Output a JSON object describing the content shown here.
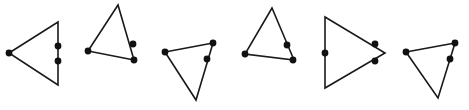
{
  "figure": {
    "canvas": {
      "width": 469,
      "height": 110,
      "background": "#ffffff"
    },
    "style": {
      "stroke_color": "#1a1a1a",
      "stroke_width": 1.6,
      "dot_color": "#111111",
      "dot_radius": 3.4
    },
    "shape_count": 6,
    "shapes": [
      {
        "name": "triangle-1",
        "orientation": "pointing-left",
        "points": "9,53 58,22 58,85",
        "dots": [
          {
            "name": "dot-apex-left",
            "cx": 9,
            "cy": 53
          },
          {
            "name": "dot-right-edge-upper",
            "cx": 58,
            "cy": 46
          },
          {
            "name": "dot-right-edge-lower",
            "cx": 58,
            "cy": 61
          }
        ]
      },
      {
        "name": "triangle-2",
        "orientation": "pointing-up-tilted",
        "points": "118,5 88,51 134,60",
        "dots": [
          {
            "name": "dot-bottom-left",
            "cx": 88,
            "cy": 51
          },
          {
            "name": "dot-right-edge",
            "cx": 133,
            "cy": 44
          },
          {
            "name": "dot-bottom-right",
            "cx": 134,
            "cy": 60
          }
        ]
      },
      {
        "name": "triangle-3",
        "orientation": "pointing-down-tilted",
        "points": "165,52 213,43 196,100",
        "dots": [
          {
            "name": "dot-top-left",
            "cx": 165,
            "cy": 52
          },
          {
            "name": "dot-top-right",
            "cx": 213,
            "cy": 43
          },
          {
            "name": "dot-right-edge",
            "cx": 207,
            "cy": 59
          }
        ]
      },
      {
        "name": "triangle-4",
        "orientation": "pointing-up",
        "points": "272,8 245,54 294,60",
        "dots": [
          {
            "name": "dot-bottom-left",
            "cx": 245,
            "cy": 54
          },
          {
            "name": "dot-right-edge",
            "cx": 287,
            "cy": 45
          },
          {
            "name": "dot-bottom-right",
            "cx": 293,
            "cy": 60
          }
        ]
      },
      {
        "name": "triangle-5",
        "orientation": "pointing-right",
        "points": "325,17 385,53 325,88",
        "dots": [
          {
            "name": "dot-left-edge-middle",
            "cx": 325,
            "cy": 53
          },
          {
            "name": "dot-upper-right-edge",
            "cx": 375,
            "cy": 44
          },
          {
            "name": "dot-lower-right-edge",
            "cx": 375,
            "cy": 61
          }
        ]
      },
      {
        "name": "triangle-6",
        "orientation": "pointing-down-tilted",
        "points": "406,52 455,43 438,98",
        "dots": [
          {
            "name": "dot-top-left",
            "cx": 406,
            "cy": 52
          },
          {
            "name": "dot-top-right",
            "cx": 455,
            "cy": 43
          },
          {
            "name": "dot-right-edge",
            "cx": 450,
            "cy": 59
          }
        ]
      }
    ]
  }
}
